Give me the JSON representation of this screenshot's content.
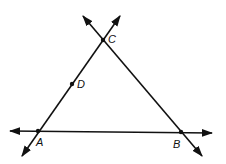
{
  "diagram": {
    "type": "geometry-lines",
    "points": {
      "A": {
        "label": "A",
        "x": 38,
        "y": 131
      },
      "B": {
        "label": "B",
        "x": 181,
        "y": 132
      },
      "C": {
        "label": "C",
        "x": 103,
        "y": 40
      },
      "D": {
        "label": "D",
        "x": 72,
        "y": 84
      }
    },
    "lines": [
      {
        "name": "line-AB",
        "through": [
          "A",
          "B"
        ],
        "arrows": "both"
      },
      {
        "name": "line-AC",
        "through": [
          "A",
          "C"
        ],
        "arrows": "both"
      },
      {
        "name": "line-BC",
        "through": [
          "B",
          "C"
        ],
        "arrows": "both"
      }
    ],
    "stroke_color": "#111111"
  }
}
